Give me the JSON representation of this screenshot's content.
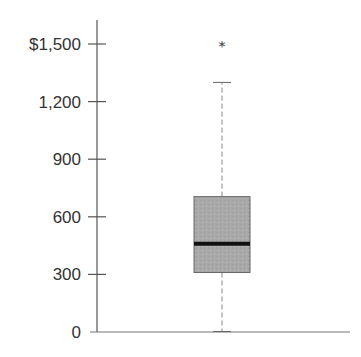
{
  "chart_data": {
    "type": "box",
    "title": "",
    "xlabel": "",
    "ylabel": "",
    "ylim": [
      0,
      1500
    ],
    "y_ticks": [
      0,
      300,
      600,
      900,
      1200,
      1500
    ],
    "y_tick_labels": [
      "0",
      "300",
      "600",
      "900",
      "1,200",
      "$1,500"
    ],
    "grid": false,
    "legend": null,
    "series": [
      {
        "name": "",
        "min": 0,
        "q1": 310,
        "median": 460,
        "q3": 705,
        "max": 1300,
        "outliers": [
          1500
        ]
      }
    ],
    "colors": {
      "box_fill": "#a8a8a8",
      "box_stroke": "#666666",
      "median": "#111111",
      "whisker": "#888888",
      "axis": "#555555"
    }
  }
}
